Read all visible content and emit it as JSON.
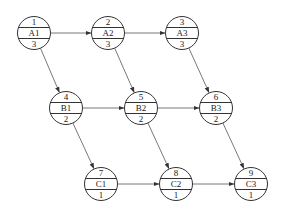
{
  "diagram": {
    "type": "network-flow",
    "nodes": [
      {
        "id": "A1",
        "top": "1",
        "label": "A1",
        "bottom": "3"
      },
      {
        "id": "A2",
        "top": "2",
        "label": "A2",
        "bottom": "3"
      },
      {
        "id": "A3",
        "top": "3",
        "label": "A3",
        "bottom": "3"
      },
      {
        "id": "B1",
        "top": "4",
        "label": "B1",
        "bottom": "2"
      },
      {
        "id": "B2",
        "top": "5",
        "label": "B2",
        "bottom": "2"
      },
      {
        "id": "B3",
        "top": "6",
        "label": "B3",
        "bottom": "2"
      },
      {
        "id": "C1",
        "top": "7",
        "label": "C1",
        "bottom": "1"
      },
      {
        "id": "C2",
        "top": "8",
        "label": "C2",
        "bottom": "1"
      },
      {
        "id": "C3",
        "top": "9",
        "label": "C3",
        "bottom": "1"
      }
    ],
    "edges": [
      {
        "from": "A1",
        "to": "A2"
      },
      {
        "from": "A2",
        "to": "A3"
      },
      {
        "from": "B1",
        "to": "B2"
      },
      {
        "from": "B2",
        "to": "B3"
      },
      {
        "from": "C1",
        "to": "C2"
      },
      {
        "from": "C2",
        "to": "C3"
      },
      {
        "from": "A1",
        "to": "B1"
      },
      {
        "from": "A2",
        "to": "B2"
      },
      {
        "from": "A3",
        "to": "B3"
      },
      {
        "from": "B1",
        "to": "C1"
      },
      {
        "from": "B2",
        "to": "C2"
      },
      {
        "from": "B3",
        "to": "C3"
      }
    ],
    "colors": {
      "stroke": "#333333",
      "edge": "#555555",
      "background": "#ffffff"
    }
  }
}
